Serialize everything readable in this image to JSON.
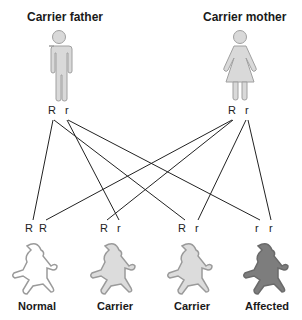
{
  "parents": {
    "father": {
      "title": "Carrier father",
      "alleles": [
        "R",
        "r"
      ],
      "fill": "#d9d9d9",
      "stroke": "#a0a0a0"
    },
    "mother": {
      "title": "Carrier mother",
      "alleles": [
        "R",
        "r"
      ],
      "fill": "#d9d9d9",
      "stroke": "#a0a0a0"
    }
  },
  "children": [
    {
      "alleles": [
        "R",
        "R"
      ],
      "label": "Normal",
      "fill": "#ffffff",
      "stroke": "#9a9a9a"
    },
    {
      "alleles": [
        "R",
        "r"
      ],
      "label": "Carrier",
      "fill": "#dcdcdc",
      "stroke": "#9a9a9a"
    },
    {
      "alleles": [
        "R",
        "r"
      ],
      "label": "Carrier",
      "fill": "#dcdcdc",
      "stroke": "#9a9a9a"
    },
    {
      "alleles": [
        "r",
        "r"
      ],
      "label": "Affected",
      "fill": "#7d7d7d",
      "stroke": "#6a6a6a"
    }
  ],
  "line_color": "#222222"
}
